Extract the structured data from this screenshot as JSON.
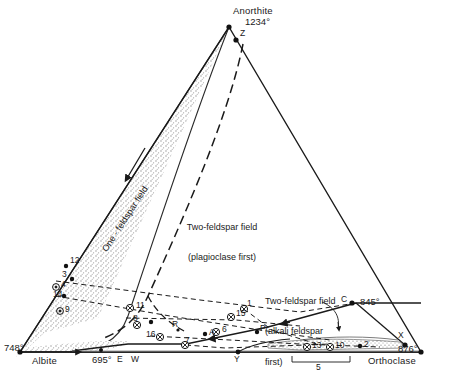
{
  "diagram": {
    "type": "ternary-phase-diagram",
    "system": "Albite - Anorthite - Orthoclase (feldspar ternary)",
    "corners": [
      {
        "id": "anorthite",
        "label": "Anorthite",
        "temperature": "1234°",
        "position": "top"
      },
      {
        "id": "albite",
        "label": "Albite",
        "temperature": "748°",
        "position": "bottom-left"
      },
      {
        "id": "orthoclase",
        "label": "Orthoclase",
        "temperature": "876°",
        "position": "bottom-right"
      }
    ],
    "fields": [
      {
        "id": "one-feldspar",
        "label": "One - feldspar field",
        "orientation": "rotated"
      },
      {
        "id": "two-feldspar-plag",
        "line1": "Two-feldspar field",
        "line2": "(plagioclase first)"
      },
      {
        "id": "two-feldspar-alkali",
        "line1": "Two-feldspar field",
        "line2": "(alkali feldspar",
        "line3": "first)"
      }
    ],
    "invariant_points": [
      {
        "id": "Z",
        "label": "Z"
      },
      {
        "id": "C",
        "label": "C",
        "temperature": "845°"
      },
      {
        "id": "X",
        "label": "X"
      },
      {
        "id": "E",
        "label": "E",
        "temperature": "695°"
      },
      {
        "id": "W",
        "label": "W"
      },
      {
        "id": "Y",
        "label": "Y"
      },
      {
        "id": "P",
        "label": "P"
      },
      {
        "id": "R",
        "label": "R"
      },
      {
        "id": "A",
        "label": "A"
      }
    ],
    "sample_points": [
      {
        "label": "12",
        "marker": "dot"
      },
      {
        "label": "3",
        "marker": "dot"
      },
      {
        "label": "4",
        "marker": "circled-dot"
      },
      {
        "label": "14",
        "marker": "dot"
      },
      {
        "label": "9",
        "marker": "circled-dot"
      },
      {
        "label": "11",
        "marker": "circled-cross"
      },
      {
        "label": "8",
        "marker": "circled-cross"
      },
      {
        "label": "16",
        "marker": "circled-cross"
      },
      {
        "label": "15",
        "marker": "circled-cross"
      },
      {
        "label": "6",
        "marker": "circled-cross"
      },
      {
        "label": "7",
        "marker": "circled-cross"
      },
      {
        "label": "13",
        "marker": "circled-cross"
      },
      {
        "label": "10",
        "marker": "circled-cross"
      },
      {
        "label": "2",
        "marker": "dot"
      },
      {
        "label": "5",
        "marker": "bracket-group"
      },
      {
        "label": "1",
        "marker": "circled-cross"
      }
    ],
    "colors": {
      "line": "#1a1a1a",
      "stipple": "#b9b9b9",
      "background": "#ffffff"
    }
  }
}
